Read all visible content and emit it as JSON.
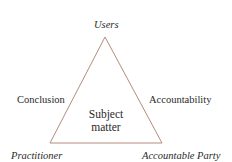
{
  "diagram": {
    "type": "triangle-relationship",
    "vertices": {
      "top": "Users",
      "bottom_left": "Practitioner",
      "bottom_right": "Accountable Party"
    },
    "edges": {
      "left": "Conclusion",
      "right": "Accountability"
    },
    "center": {
      "line1": "Subject",
      "line2": "matter"
    },
    "colors": {
      "triangle_stroke": "#b48c7c",
      "text": "#2a2a2a",
      "background": "#ffffff"
    }
  }
}
